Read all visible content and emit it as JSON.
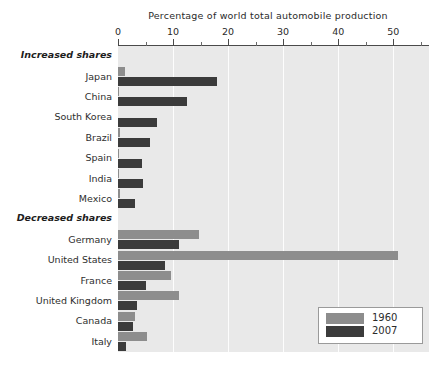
{
  "chart_data": {
    "type": "bar",
    "orientation": "horizontal",
    "title": "",
    "xlabel": "Percentage of world total automobile production",
    "ylabel": "",
    "xlim": [
      0,
      56.5
    ],
    "xticks": [
      0,
      10,
      20,
      30,
      40,
      50
    ],
    "xtick_labels": [
      "0",
      "10",
      "20",
      "30",
      "40",
      "50"
    ],
    "minor_tick_interval": 5,
    "grid": true,
    "grid_axis": "x",
    "grid_color": "#ffffff",
    "plot_background": "#e9e9e9",
    "legend_position": "lower right",
    "group_headers": [
      "Increased shares",
      "Decreased shares"
    ],
    "categories": [
      "Japan",
      "China",
      "South Korea",
      "Brazil",
      "Spain",
      "India",
      "Mexico",
      "Germany",
      "United States",
      "France",
      "United Kingdom",
      "Canada",
      "Italy"
    ],
    "series": [
      {
        "name": "1960",
        "color": "#8d8d8d",
        "values": [
          1.3,
          0.1,
          0.0,
          0.4,
          0.2,
          0.1,
          0.3,
          14.7,
          50.8,
          9.7,
          11.0,
          3.0,
          5.3
        ]
      },
      {
        "name": "2007",
        "color": "#3b3b3b",
        "values": [
          18.0,
          12.6,
          7.0,
          5.8,
          4.3,
          4.5,
          3.0,
          11.0,
          8.5,
          5.0,
          3.5,
          2.7,
          1.5
        ]
      }
    ],
    "rows": [
      {
        "kind": "header",
        "label": "Increased shares"
      },
      {
        "kind": "category",
        "label": "Japan",
        "v1960": 1.3,
        "v2007": 18.0
      },
      {
        "kind": "category",
        "label": "China",
        "v1960": 0.1,
        "v2007": 12.6
      },
      {
        "kind": "category",
        "label": "South Korea",
        "v1960": 0.0,
        "v2007": 7.0
      },
      {
        "kind": "category",
        "label": "Brazil",
        "v1960": 0.4,
        "v2007": 5.8
      },
      {
        "kind": "category",
        "label": "Spain",
        "v1960": 0.2,
        "v2007": 4.3
      },
      {
        "kind": "category",
        "label": "India",
        "v1960": 0.1,
        "v2007": 4.5
      },
      {
        "kind": "category",
        "label": "Mexico",
        "v1960": 0.3,
        "v2007": 3.0
      },
      {
        "kind": "header",
        "label": "Decreased shares"
      },
      {
        "kind": "category",
        "label": "Germany",
        "v1960": 14.7,
        "v2007": 11.0
      },
      {
        "kind": "category",
        "label": "United States",
        "v1960": 50.8,
        "v2007": 8.5
      },
      {
        "kind": "category",
        "label": "France",
        "v1960": 9.7,
        "v2007": 5.0
      },
      {
        "kind": "category",
        "label": "United Kingdom",
        "v1960": 11.0,
        "v2007": 3.5
      },
      {
        "kind": "category",
        "label": "Canada",
        "v1960": 3.0,
        "v2007": 2.7
      },
      {
        "kind": "category",
        "label": "Italy",
        "v1960": 5.3,
        "v2007": 1.5
      }
    ],
    "legend": [
      {
        "label": "1960",
        "color": "#8d8d8d"
      },
      {
        "label": "2007",
        "color": "#3b3b3b"
      }
    ]
  }
}
